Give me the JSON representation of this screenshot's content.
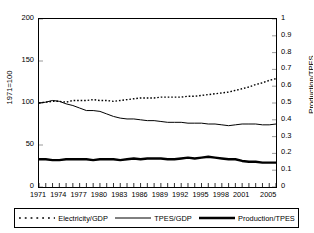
{
  "chart_data": {
    "type": "line",
    "title": "",
    "xlabel": "",
    "ylabel": "1971=100",
    "ylabel_right": "Production/TPES",
    "xlim": [
      1971,
      2006
    ],
    "ylim": [
      0,
      200
    ],
    "ylim_right": [
      0,
      1
    ],
    "grid": false,
    "legend_position": "bottom",
    "x": [
      1971,
      1972,
      1973,
      1974,
      1975,
      1976,
      1977,
      1978,
      1979,
      1980,
      1981,
      1982,
      1983,
      1984,
      1985,
      1986,
      1987,
      1988,
      1989,
      1990,
      1991,
      1992,
      1993,
      1994,
      1995,
      1996,
      1997,
      1998,
      1999,
      2000,
      2001,
      2002,
      2003,
      2004,
      2005,
      2006
    ],
    "xticks": [
      1971,
      1974,
      1977,
      1980,
      1983,
      1986,
      1989,
      1992,
      1995,
      1998,
      2001,
      2005
    ],
    "yticks": [
      0,
      50,
      100,
      150,
      200
    ],
    "yticks_right": [
      0,
      0.1,
      0.2,
      0.3,
      0.4,
      0.5,
      0.6,
      0.7,
      0.8,
      0.9,
      1
    ],
    "series": [
      {
        "name": "Electricity/GDP",
        "style": "dotted",
        "axis": "right",
        "color": "#000000",
        "values_index": [
          100,
          101,
          102,
          102,
          101,
          103,
          103,
          103,
          104,
          103,
          103,
          102,
          103,
          104,
          105,
          106,
          106,
          106,
          107,
          107,
          107,
          107,
          108,
          108,
          109,
          110,
          111,
          112,
          113,
          115,
          117,
          119,
          122,
          124,
          127,
          129
        ],
        "values_right": [
          0.5,
          0.505,
          0.51,
          0.51,
          0.505,
          0.515,
          0.515,
          0.515,
          0.52,
          0.515,
          0.515,
          0.51,
          0.515,
          0.52,
          0.525,
          0.53,
          0.53,
          0.53,
          0.535,
          0.535,
          0.535,
          0.535,
          0.54,
          0.54,
          0.545,
          0.55,
          0.555,
          0.56,
          0.565,
          0.575,
          0.585,
          0.595,
          0.61,
          0.62,
          0.635,
          0.645
        ]
      },
      {
        "name": "TPES/GDP",
        "style": "thin-solid",
        "axis": "right",
        "color": "#000000",
        "values_index": [
          100,
          101,
          103,
          102,
          99,
          97,
          94,
          91,
          91,
          90,
          87,
          84,
          82,
          81,
          81,
          80,
          79,
          79,
          78,
          77,
          77,
          77,
          76,
          76,
          76,
          75,
          75,
          74,
          73,
          74,
          75,
          75,
          75,
          74,
          74,
          75
        ],
        "values_right": [
          0.5,
          0.505,
          0.515,
          0.51,
          0.495,
          0.485,
          0.47,
          0.455,
          0.455,
          0.45,
          0.435,
          0.42,
          0.41,
          0.405,
          0.405,
          0.4,
          0.395,
          0.395,
          0.39,
          0.385,
          0.385,
          0.385,
          0.38,
          0.38,
          0.38,
          0.375,
          0.375,
          0.37,
          0.365,
          0.37,
          0.375,
          0.375,
          0.375,
          0.37,
          0.37,
          0.375
        ]
      },
      {
        "name": "Production/TPES",
        "style": "thick-solid",
        "axis": "right",
        "color": "#000000",
        "values_index": [
          33,
          33,
          32,
          32,
          33,
          33,
          33,
          33,
          32,
          33,
          33,
          33,
          32,
          33,
          34,
          33,
          34,
          34,
          34,
          33,
          33,
          34,
          35,
          34,
          35,
          36,
          35,
          34,
          33,
          33,
          31,
          30,
          30,
          29,
          29,
          29
        ],
        "values_right": [
          0.165,
          0.165,
          0.16,
          0.16,
          0.165,
          0.165,
          0.165,
          0.165,
          0.16,
          0.165,
          0.165,
          0.165,
          0.16,
          0.165,
          0.17,
          0.165,
          0.17,
          0.17,
          0.17,
          0.165,
          0.165,
          0.17,
          0.175,
          0.17,
          0.175,
          0.18,
          0.175,
          0.17,
          0.165,
          0.165,
          0.155,
          0.15,
          0.15,
          0.145,
          0.145,
          0.145
        ]
      }
    ]
  },
  "axes": {
    "left": {
      "title": "1971=100",
      "ticks": [
        "0",
        "50",
        "100",
        "150",
        "200"
      ]
    },
    "right": {
      "title": "Production/TPES",
      "ticks": [
        "0",
        "0.1",
        "0.2",
        "0.3",
        "0.4",
        "0.5",
        "0.6",
        "0.7",
        "0.8",
        "0.9",
        "1"
      ]
    },
    "bottom": {
      "ticks": [
        "1971",
        "1974",
        "1977",
        "1980",
        "1983",
        "1986",
        "1989",
        "1992",
        "1995",
        "1998",
        "2001",
        "2005"
      ]
    }
  },
  "legend": {
    "items": [
      {
        "label": "Electricity/GDP",
        "style": "dotted"
      },
      {
        "label": "TPES/GDP",
        "style": "thin-solid"
      },
      {
        "label": "Production/TPES",
        "style": "thick-solid"
      }
    ]
  }
}
